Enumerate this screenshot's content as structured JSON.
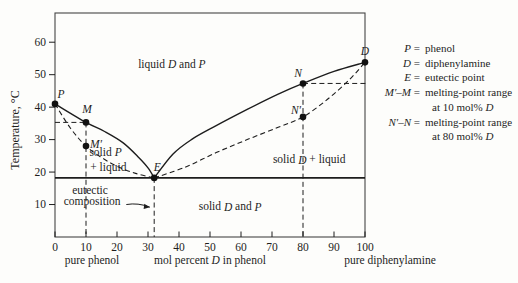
{
  "figure": {
    "background": "#fdfdfb",
    "ink": "#1d1d1d",
    "box_color": "#454545"
  },
  "chart_data": {
    "type": "line",
    "title": "",
    "xlabel": "mol percent D in phenol",
    "ylabel": "Temperature, °C",
    "x_axis_left_caption": "pure phenol",
    "x_axis_right_caption": "pure diphenylamine",
    "xlim": [
      0,
      100
    ],
    "ylim": [
      0,
      69
    ],
    "xticks": [
      0,
      10,
      20,
      30,
      40,
      50,
      60,
      70,
      80,
      90,
      100
    ],
    "yticks": [
      10,
      20,
      30,
      40,
      50,
      60
    ],
    "grid": false,
    "eutectic": {
      "mol_percent_D": 32,
      "temperature_C": 18
    },
    "series": [
      {
        "name": "liquidus-left-solid",
        "style": "solid",
        "width": 1.4,
        "points": [
          [
            0,
            41
          ],
          [
            10,
            35.3
          ],
          [
            16,
            32.5
          ],
          [
            22,
            29
          ],
          [
            27,
            24.5
          ],
          [
            30,
            21.3
          ],
          [
            32,
            18.2
          ]
        ]
      },
      {
        "name": "liquidus-right-solid",
        "style": "solid",
        "width": 1.4,
        "points": [
          [
            32,
            18.2
          ],
          [
            38,
            25.5
          ],
          [
            44,
            30
          ],
          [
            52,
            34.3
          ],
          [
            62,
            39.3
          ],
          [
            72,
            44
          ],
          [
            80,
            47.3
          ],
          [
            90,
            51
          ],
          [
            100,
            53.8
          ]
        ]
      },
      {
        "name": "solidus-left-dashed",
        "style": "dashed",
        "width": 1.1,
        "points": [
          [
            0,
            41
          ],
          [
            5,
            33.5
          ],
          [
            10,
            28
          ],
          [
            15,
            24.5
          ],
          [
            20,
            21.8
          ],
          [
            26,
            19.6
          ],
          [
            32,
            18.2
          ]
        ]
      },
      {
        "name": "solidus-right-dashed",
        "style": "dashed",
        "width": 1.1,
        "points": [
          [
            32,
            18.2
          ],
          [
            42,
            21.5
          ],
          [
            52,
            26
          ],
          [
            62,
            30
          ],
          [
            72,
            33.8
          ],
          [
            80,
            37
          ],
          [
            88,
            42.5
          ],
          [
            95,
            48.5
          ],
          [
            100,
            53.8
          ]
        ]
      },
      {
        "name": "eutectic-horizontal-line",
        "style": "solid",
        "width": 1.7,
        "points": [
          [
            0,
            18.2
          ],
          [
            100,
            18.2
          ]
        ]
      }
    ],
    "points": [
      {
        "label": "P",
        "x": 0,
        "y": 41,
        "dx": 6,
        "dy": -6
      },
      {
        "label": "M",
        "x": 10,
        "y": 35.3,
        "dx": 1,
        "dy": -9
      },
      {
        "label": "M′",
        "x": 10,
        "y": 28,
        "dx": 10,
        "dy": 2
      },
      {
        "label": "E",
        "x": 32,
        "y": 18.2,
        "dx": 3,
        "dy": -7
      },
      {
        "label": "N",
        "x": 80,
        "y": 47.3,
        "dx": -5,
        "dy": -6
      },
      {
        "label": "N′",
        "x": 80,
        "y": 37,
        "dx": -7,
        "dy": -3
      },
      {
        "label": "D",
        "x": 100,
        "y": 53.8,
        "dx": 0,
        "dy": -7
      }
    ],
    "dashed_vertical_guides": [
      {
        "x": 10,
        "from_y": 35.3,
        "to_y": 0
      },
      {
        "x": 32,
        "from_y": 18.2,
        "to_y": 0
      },
      {
        "x": 80,
        "from_y": 47.3,
        "to_y": 0
      }
    ],
    "dashed_horizontal_guides": [
      {
        "y": 35.3,
        "from_x": 0,
        "to_x": 10
      },
      {
        "y": 47.3,
        "from_x": 80,
        "to_x": 101
      }
    ],
    "region_labels": [
      {
        "text": "liquid D and P",
        "x": 37.7,
        "y": 53
      },
      {
        "text": "solid P",
        "x": 16.3,
        "y": 25.8
      },
      {
        "text": "+ liquid",
        "x": 17.2,
        "y": 21
      },
      {
        "text": "solid D + liquid",
        "x": 82,
        "y": 23.5
      },
      {
        "text": "solid D and P",
        "x": 56.5,
        "y": 9
      },
      {
        "text": "eutectic",
        "x": 11.3,
        "y": 14.2
      },
      {
        "text": "composition",
        "x": 12,
        "y": 10.6
      }
    ],
    "annotation_arrow": {
      "from": [
        23,
        10
      ],
      "to": [
        30.6,
        9.2
      ]
    }
  },
  "legend": {
    "entries": [
      {
        "label": "P =",
        "text": "phenol"
      },
      {
        "label": "D =",
        "text": "diphenylamine"
      },
      {
        "label": "E =",
        "text": "eutectic point"
      },
      {
        "label": "M′–M =",
        "text": "melting-point range",
        "text2": "at 10 mol% D"
      },
      {
        "label": "N′–N =",
        "text": "melting-point range",
        "text2": "at 80 mol% D"
      }
    ]
  }
}
